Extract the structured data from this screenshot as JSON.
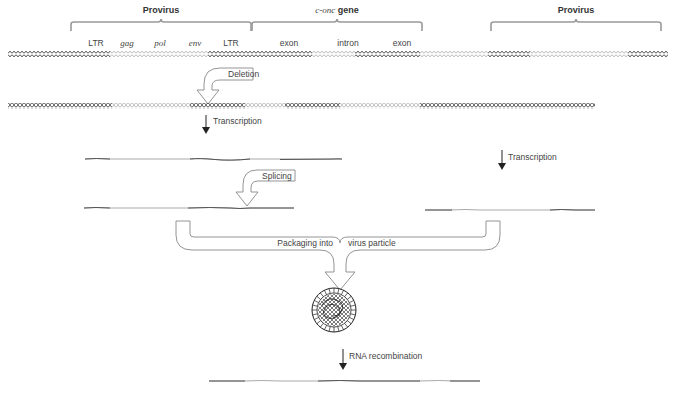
{
  "colors": {
    "dark_strand": "#555555",
    "light_strand": "#bbbbbb",
    "bracket": "#999999",
    "arrow_outline": "#888888",
    "text": "#444444"
  },
  "brackets": [
    {
      "id": "provirus-left",
      "label": "Provirus",
      "x1": 71,
      "x2": 251
    },
    {
      "id": "c-onc-gene",
      "label_italic": "c-onc",
      "label_bold": " gene",
      "x1": 252,
      "x2": 422
    },
    {
      "id": "provirus-right",
      "label": "Provirus",
      "x1": 491,
      "x2": 661
    }
  ],
  "top_labels": [
    {
      "text": "LTR",
      "x": 96,
      "style": "normal"
    },
    {
      "text": "gag",
      "x": 127,
      "style": "italic"
    },
    {
      "text": "pol",
      "x": 160,
      "style": "italic"
    },
    {
      "text": "env",
      "x": 195,
      "style": "italic"
    },
    {
      "text": "LTR",
      "x": 231,
      "style": "normal"
    },
    {
      "text": "exon",
      "x": 289,
      "style": "normal"
    },
    {
      "text": "intron",
      "x": 348,
      "style": "normal"
    },
    {
      "text": "exon",
      "x": 402,
      "style": "normal"
    }
  ],
  "steps": {
    "deletion": "Deletion",
    "transcription_left": "Transcription",
    "transcription_right": "Transcription",
    "splicing": "Splicing",
    "packaging_a": "Packaging into",
    "packaging_b": "virus particle",
    "rna_recombination": "RNA recombination"
  },
  "dna_row1_segments": [
    {
      "x1": 8,
      "x2": 110,
      "tone": "dark"
    },
    {
      "x1": 110,
      "x2": 208,
      "tone": "light"
    },
    {
      "x1": 208,
      "x2": 312,
      "tone": "dark"
    },
    {
      "x1": 312,
      "x2": 355,
      "tone": "light"
    },
    {
      "x1": 355,
      "x2": 420,
      "tone": "dark"
    },
    {
      "x1": 420,
      "x2": 488,
      "tone": "light"
    },
    {
      "x1": 488,
      "x2": 530,
      "tone": "dark"
    },
    {
      "x1": 530,
      "x2": 628,
      "tone": "light"
    },
    {
      "x1": 628,
      "x2": 668,
      "tone": "dark"
    }
  ],
  "dna_row2_segments": [
    {
      "x1": 8,
      "x2": 112,
      "tone": "dark"
    },
    {
      "x1": 112,
      "x2": 190,
      "tone": "light"
    },
    {
      "x1": 190,
      "x2": 245,
      "tone": "dark"
    },
    {
      "x1": 245,
      "x2": 285,
      "tone": "light"
    },
    {
      "x1": 285,
      "x2": 340,
      "tone": "dark"
    },
    {
      "x1": 340,
      "x2": 420,
      "tone": "light"
    },
    {
      "x1": 420,
      "x2": 595,
      "tone": "dark"
    }
  ]
}
